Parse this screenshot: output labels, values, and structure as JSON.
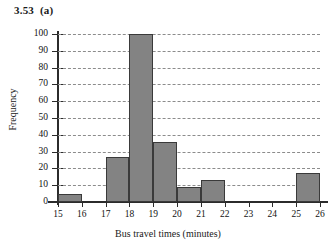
{
  "figure": {
    "number_label": "3.53  (a)"
  },
  "chart_data": {
    "type": "bar",
    "title": "3.53  (a)",
    "xlabel": "Bus travel times (minutes)",
    "ylabel": "Frequency",
    "xlim": [
      15,
      26
    ],
    "ylim": [
      0,
      100
    ],
    "grid": true,
    "legend": false,
    "bin_width": 1,
    "x_tick_labels": [
      "15",
      "16",
      "17",
      "18",
      "19",
      "20",
      "21",
      "22",
      "23",
      "24",
      "25",
      "26"
    ],
    "y_tick_labels": [
      "0",
      "10",
      "20",
      "30",
      "40",
      "50",
      "60",
      "70",
      "80",
      "90",
      "100"
    ],
    "bin_edges": [
      15,
      16,
      17,
      18,
      19,
      20,
      21,
      22,
      23,
      24,
      25,
      26
    ],
    "categories": [
      "15-16",
      "16-17",
      "17-18",
      "18-19",
      "19-20",
      "20-21",
      "21-22",
      "22-23",
      "23-24",
      "24-25",
      "25-26"
    ],
    "values": [
      5,
      0,
      27,
      100,
      36,
      9,
      13,
      0,
      0,
      0,
      17
    ],
    "bar_color": "#838383",
    "bar_edge_color": "#3a3a3a",
    "gridline_color": "#8c8c8c",
    "axis_color": "#2b2b2b"
  }
}
